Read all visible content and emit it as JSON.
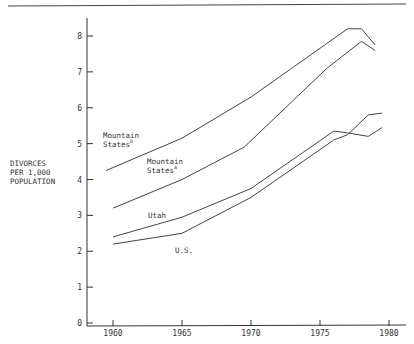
{
  "chart_data": {
    "type": "line",
    "title": "",
    "xlabel": "",
    "ylabel": "DIVORCES PER 1,000 POPULATION",
    "ylabel_lines": [
      "DIVORCES",
      "PER 1,000",
      "POPULATION"
    ],
    "xlim": [
      1958,
      1981
    ],
    "ylim": [
      0,
      8.5
    ],
    "x_ticks": [
      1960,
      1965,
      1970,
      1975,
      1980
    ],
    "y_ticks": [
      0,
      1,
      2,
      3,
      4,
      5,
      6,
      7,
      8
    ],
    "grid": false,
    "legend": "inline labels",
    "series": [
      {
        "name": "Mountain States (b)",
        "label": "Mountain",
        "label2": "States",
        "superscript": "b",
        "points": [
          [
            1959.5,
            4.25
          ],
          [
            1965,
            5.15
          ],
          [
            1970,
            6.3
          ],
          [
            1977,
            8.2
          ],
          [
            1978,
            8.2
          ],
          [
            1979,
            7.75
          ]
        ]
      },
      {
        "name": "Mountain States (a)",
        "label": "Mountain",
        "label2": "States",
        "superscript": "a",
        "points": [
          [
            1960,
            3.2
          ],
          [
            1965,
            4.0
          ],
          [
            1969.5,
            4.9
          ],
          [
            1975.5,
            7.1
          ],
          [
            1978,
            7.85
          ],
          [
            1979,
            7.6
          ]
        ]
      },
      {
        "name": "Utah",
        "label": "Utah",
        "points": [
          [
            1960,
            2.4
          ],
          [
            1965,
            2.95
          ],
          [
            1970,
            3.75
          ],
          [
            1976,
            5.35
          ],
          [
            1977,
            5.3
          ],
          [
            1978.5,
            5.2
          ],
          [
            1979.5,
            5.45
          ]
        ]
      },
      {
        "name": "U.S.",
        "label": "U.S.",
        "points": [
          [
            1960,
            2.2
          ],
          [
            1965,
            2.5
          ],
          [
            1970,
            3.5
          ],
          [
            1976,
            5.1
          ],
          [
            1977,
            5.25
          ],
          [
            1978.5,
            5.8
          ],
          [
            1979.5,
            5.85
          ]
        ]
      }
    ]
  }
}
